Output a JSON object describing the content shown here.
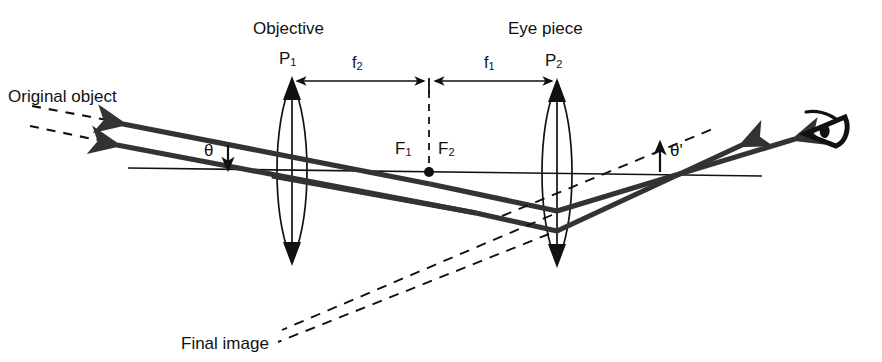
{
  "figure": {
    "kind": "ray-diagram",
    "background_color": "#ffffff",
    "stroke_color": "#111111",
    "ray_color": "#333333"
  },
  "labels": {
    "objective": "Objective",
    "eye_piece": "Eye piece",
    "original_object": "Original object",
    "final_image": "Final image",
    "p1_main": "P",
    "p1_sub": "1",
    "p2_main": "P",
    "p2_sub": "2",
    "f2_main": "f",
    "f2_sub": "2",
    "f1_main": "f",
    "f1_sub": "1",
    "cap_f1_main": "F",
    "cap_f1_sub": "1",
    "cap_f2_main": "F",
    "cap_f2_sub": "2",
    "theta": "θ",
    "theta_prime": "θ'"
  },
  "elements": {
    "objective_lens": {
      "name": "objective-lens",
      "center_x": 292,
      "top_y": 78,
      "bottom_y": 264,
      "half_width": 20
    },
    "eyepiece_lens": {
      "name": "eyepiece-lens",
      "center_x": 557,
      "top_y": 80,
      "bottom_y": 264,
      "half_width": 20
    },
    "optical_axis": {
      "name": "optical-axis",
      "x1": 128,
      "y1": 168,
      "x2": 760,
      "y2": 176
    },
    "focal_point": {
      "name": "common-focal-point",
      "x": 429,
      "y": 172,
      "radius": 5
    },
    "focal_plane_dashed": {
      "name": "focal-plane-dashed-line",
      "x": 429,
      "y_top": 80,
      "y_bottom": 172
    },
    "eye_icon": {
      "name": "observer-eye-icon",
      "x": 812,
      "y": 112,
      "width": 46,
      "height": 36
    }
  },
  "measurements": {
    "f2": {
      "label": "f2",
      "from_x": 296,
      "to_x": 426,
      "y": 81
    },
    "f1": {
      "label": "f1",
      "from_x": 433,
      "to_x": 552,
      "y": 81
    }
  },
  "angles": {
    "theta": {
      "label": "theta",
      "x": 214,
      "y": 152,
      "marker": "down-arrow"
    },
    "theta_prime": {
      "label": "theta-prime",
      "x": 672,
      "y": 152,
      "marker": "up-arrow"
    }
  }
}
